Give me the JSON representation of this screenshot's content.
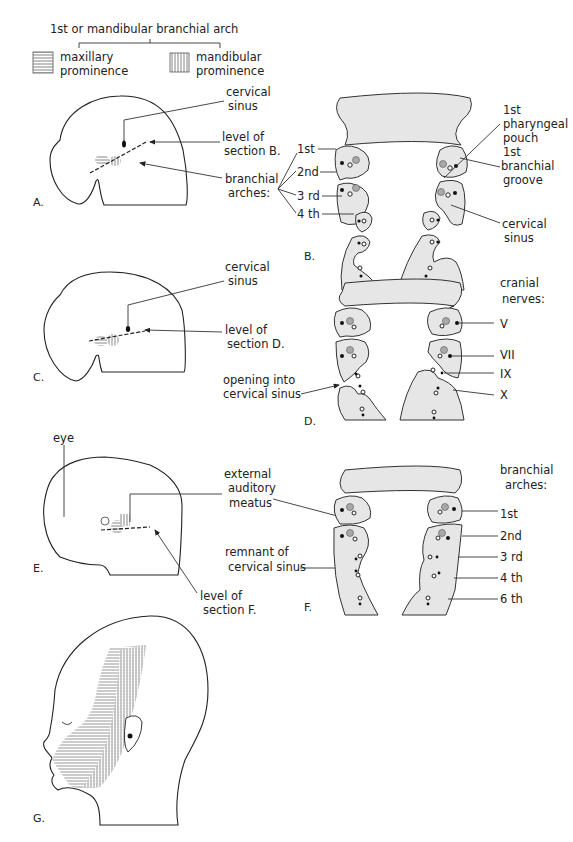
{
  "legend": {
    "title": "1st or mandibular branchial arch",
    "items": [
      {
        "label_line1": "maxillary",
        "label_line2": "prominence",
        "pattern": "horizontal-hatch"
      },
      {
        "label_line1": "mandibular",
        "label_line2": "prominence",
        "pattern": "vertical-hatch"
      }
    ]
  },
  "panels": {
    "A": {
      "letter": "A.",
      "labels": {
        "cervical_sinus_1": "cervical",
        "cervical_sinus_2": "sinus",
        "level_1": "level of",
        "level_2": "section B.",
        "arches_1": "branchial",
        "arches_2": "arches:"
      }
    },
    "B": {
      "letter": "B.",
      "arch_labels": [
        "1st",
        "2nd",
        "3 rd",
        "4 th"
      ],
      "labels": {
        "pouch_1": "1st",
        "pouch_2": "pharyngeal",
        "pouch_3": "pouch",
        "groove_1": "1st",
        "groove_2": "branchial",
        "groove_3": "groove",
        "sinus_1": "cervical",
        "sinus_2": "sinus"
      }
    },
    "C": {
      "letter": "C.",
      "labels": {
        "cervical_sinus_1": "cervical",
        "cervical_sinus_2": "sinus",
        "level_1": "level of",
        "level_2": "section D."
      }
    },
    "D": {
      "letter": "D.",
      "labels": {
        "opening_1": "opening into",
        "opening_2": "cervical sinus",
        "nerves_1": "cranial",
        "nerves_2": "nerves:"
      },
      "nerve_labels": [
        "V",
        "VII",
        "IX",
        "X"
      ]
    },
    "E": {
      "letter": "E.",
      "labels": {
        "eye": "eye",
        "meatus_1": "external",
        "meatus_2": "auditory",
        "meatus_3": "meatus",
        "level_1": "level of",
        "level_2": "section F."
      }
    },
    "F": {
      "letter": "F.",
      "labels": {
        "remnant_1": "remnant of",
        "remnant_2": "cervical sinus",
        "arches_1": "branchial",
        "arches_2": "arches:"
      },
      "arch_labels": [
        "1st",
        "2nd",
        "3 rd",
        "4 th",
        "6 th"
      ]
    },
    "G": {
      "letter": "G."
    }
  },
  "colors": {
    "section_fill": "#e6e6e6",
    "ink": "#222222",
    "ganglion_gray": "#a9a9a9"
  }
}
